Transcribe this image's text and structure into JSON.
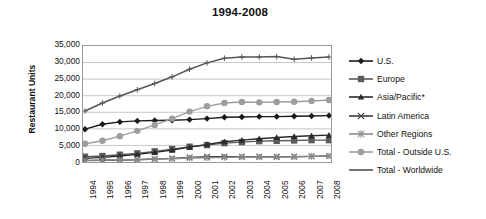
{
  "chart_data": {
    "type": "line",
    "title": "1994-2008",
    "xlabel": "",
    "ylabel": "Restaurant Units",
    "ylim": [
      0,
      35000
    ],
    "ytick_labels": [
      "35,000",
      "30,000",
      "25,000",
      "20,000",
      "15,000",
      "10,000",
      "5,000",
      "0"
    ],
    "ytick_values": [
      35000,
      30000,
      25000,
      20000,
      15000,
      10000,
      5000,
      0
    ],
    "grid": true,
    "legend_position": "right",
    "categories": [
      "1994",
      "1995",
      "1996",
      "1997",
      "1998",
      "1999",
      "2000",
      "2001",
      "2002",
      "2003",
      "2004",
      "2005",
      "2006",
      "2007",
      "2008"
    ],
    "x": [
      1994,
      1995,
      1996,
      1997,
      1998,
      1999,
      2000,
      2001,
      2002,
      2003,
      2004,
      2005,
      2006,
      2007,
      2008
    ],
    "series": [
      {
        "name": "U.S.",
        "marker": "diamond",
        "color": "#1a1a1a",
        "values": [
          9900,
          11400,
          12100,
          12400,
          12500,
          12600,
          12800,
          13100,
          13500,
          13600,
          13700,
          13700,
          13800,
          13900,
          14000
        ]
      },
      {
        "name": "Europe",
        "marker": "square",
        "color": "#5b5b5b",
        "values": [
          1600,
          1800,
          2200,
          2600,
          3200,
          3900,
          4600,
          5100,
          5700,
          6000,
          6300,
          6400,
          6500,
          6600,
          6600
        ]
      },
      {
        "name": "Asia/Pacific*",
        "marker": "triangle",
        "color": "#2b2b2b",
        "values": [
          1100,
          1400,
          1800,
          2300,
          2900,
          3600,
          4500,
          5300,
          6100,
          6600,
          7000,
          7400,
          7700,
          7900,
          8100
        ]
      },
      {
        "name": "Latin America",
        "marker": "x",
        "color": "#3d3d3d",
        "values": [
          400,
          500,
          600,
          700,
          900,
          1100,
          1400,
          1600,
          1600,
          1600,
          1600,
          1600,
          1600,
          1700,
          1800
        ]
      },
      {
        "name": "Other Regions",
        "marker": "star",
        "color": "#8c8c8c",
        "values": [
          500,
          600,
          700,
          800,
          900,
          1000,
          1200,
          1300,
          1400,
          1500,
          1500,
          1500,
          1600,
          1700,
          1800
        ]
      },
      {
        "name": "Total - Outside U.S.",
        "marker": "circle",
        "color": "#9d9d9d",
        "values": [
          5500,
          6400,
          7800,
          9400,
          11200,
          13100,
          15200,
          16800,
          17800,
          18100,
          18000,
          18100,
          18200,
          18400,
          18700
        ]
      },
      {
        "name": "Total - Worldwide",
        "marker": "plus",
        "color": "#555555",
        "values": [
          15400,
          17800,
          19900,
          21800,
          23700,
          25700,
          28000,
          29900,
          31300,
          31700,
          31700,
          31800,
          31000,
          31400,
          31700
        ]
      }
    ]
  },
  "legend": {
    "items": [
      {
        "label": "U.S."
      },
      {
        "label": "Europe"
      },
      {
        "label": "Asia/Pacific*"
      },
      {
        "label": "Latin America"
      },
      {
        "label": "Other Regions"
      },
      {
        "label": "Total - Outside U.S."
      },
      {
        "label": "Total - Worldwide"
      }
    ]
  }
}
